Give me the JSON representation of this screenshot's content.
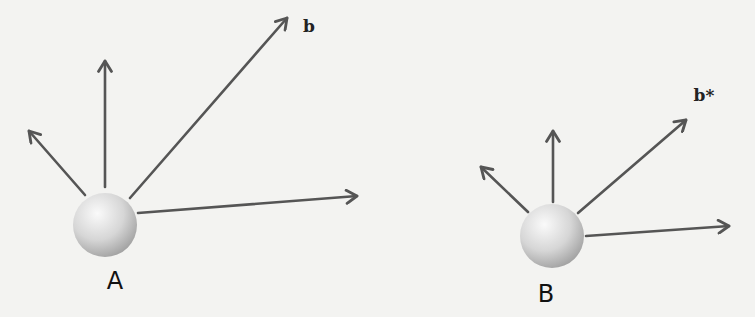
{
  "diagram": {
    "background": "#f3f3f1",
    "arrow_color": "#555555",
    "sphere_colors": {
      "highlight": "#fafafa",
      "mid": "#d6d6d6",
      "shadow": "#9c9c9c"
    },
    "figures": [
      {
        "id": "A",
        "label": "A",
        "vector_label": "b",
        "sphere": {
          "cx": 105,
          "cy": 225,
          "r": 32
        },
        "label_pos": {
          "x": 115,
          "y": 289
        },
        "vector_label_pos": {
          "x": 309,
          "y": 32
        },
        "arrows": [
          {
            "name": "arrow-upper-left",
            "x1": 85,
            "y1": 195,
            "x2": 29,
            "y2": 131
          },
          {
            "name": "arrow-up",
            "x1": 105,
            "y1": 187,
            "x2": 105,
            "y2": 61
          },
          {
            "name": "arrow-b",
            "x1": 130,
            "y1": 198,
            "x2": 287,
            "y2": 18
          },
          {
            "name": "arrow-right",
            "x1": 138,
            "y1": 213,
            "x2": 357,
            "y2": 196
          }
        ]
      },
      {
        "id": "B",
        "label": "B",
        "vector_label": "b*",
        "sphere": {
          "cx": 552,
          "cy": 236,
          "r": 32
        },
        "label_pos": {
          "x": 546,
          "y": 302
        },
        "vector_label_pos": {
          "x": 704,
          "y": 101
        },
        "arrows": [
          {
            "name": "arrow-upper-left",
            "x1": 528,
            "y1": 212,
            "x2": 481,
            "y2": 167
          },
          {
            "name": "arrow-up",
            "x1": 553,
            "y1": 202,
            "x2": 553,
            "y2": 131
          },
          {
            "name": "arrow-b-star",
            "x1": 578,
            "y1": 213,
            "x2": 686,
            "y2": 120
          },
          {
            "name": "arrow-right",
            "x1": 586,
            "y1": 236,
            "x2": 729,
            "y2": 226
          }
        ]
      }
    ]
  }
}
